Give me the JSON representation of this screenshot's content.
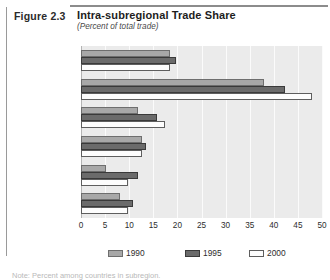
{
  "figure": {
    "number_label": "Figure 2.3",
    "title": "Intra-subregional Trade Share",
    "subtitle": "(Percent of total trade)"
  },
  "footnote": "Note: Percent among countries in subregion.",
  "colors": {
    "series_1990": "#a8a8a8",
    "series_1995": "#6b6b6b",
    "series_2000": "#fdfdfd",
    "plot_background": "#ebebeb",
    "gridline": "#fbfbfb",
    "rule": "#8c8c8c"
  },
  "legend": {
    "position": "bottom",
    "entries": [
      {
        "label": "1990",
        "swatch": "series_1990"
      },
      {
        "label": "1995",
        "swatch": "series_1995"
      },
      {
        "label": "2000",
        "swatch": "series_2000"
      }
    ]
  },
  "chart_data": {
    "type": "bar",
    "orientation": "horizontal",
    "title": "Intra-subregional Trade Share",
    "subtitle": "(Percent of total trade)",
    "xlabel": "",
    "ylabel": "",
    "xlim": [
      0,
      50
    ],
    "xticks": [
      0,
      5,
      10,
      15,
      20,
      25,
      30,
      35,
      40,
      45,
      50
    ],
    "xtick_labels": [
      "0",
      "5",
      "10",
      "15",
      "20",
      "25",
      "30",
      "35",
      "40",
      "45",
      "50"
    ],
    "grid": true,
    "grid_axis": "x",
    "legend_position": "bottom",
    "categories": [
      "Latin America/\nCaribbean",
      "NAFTA",
      "Mercosur",
      "CACM",
      "AC",
      "CARICOM"
    ],
    "series": [
      {
        "name": "1990",
        "values": [
          18.5,
          38.0,
          11.8,
          12.7,
          5.2,
          8.1
        ]
      },
      {
        "name": "1995",
        "values": [
          19.7,
          42.3,
          15.8,
          13.5,
          11.8,
          10.8
        ]
      },
      {
        "name": "2000",
        "values": [
          18.5,
          48.0,
          17.4,
          12.7,
          9.7,
          9.7
        ]
      }
    ]
  }
}
